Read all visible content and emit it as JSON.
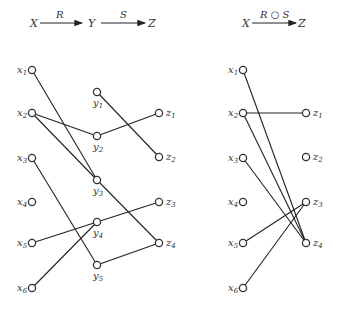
{
  "left": {
    "header": {
      "from": "X",
      "mid": "Y",
      "to": "Z",
      "rel1": "R",
      "rel2": "S"
    },
    "x_nodes": [
      "1",
      "2",
      "3",
      "4",
      "5",
      "6"
    ],
    "y_nodes": [
      "1",
      "2",
      "3",
      "4",
      "5"
    ],
    "z_nodes": [
      "1",
      "2",
      "3",
      "4"
    ],
    "R": [
      [
        "x1",
        "y3"
      ],
      [
        "x2",
        "y2"
      ],
      [
        "x2",
        "y3"
      ],
      [
        "x3",
        "y5"
      ],
      [
        "x5",
        "y4"
      ],
      [
        "x6",
        "y4"
      ]
    ],
    "S": [
      [
        "y1",
        "z2"
      ],
      [
        "y2",
        "z1"
      ],
      [
        "y3",
        "z4"
      ],
      [
        "y4",
        "z3"
      ],
      [
        "y5",
        "z4"
      ]
    ]
  },
  "right": {
    "header": {
      "from": "X",
      "to": "Z",
      "rel": "R ○ S"
    },
    "x_nodes": [
      "1",
      "2",
      "3",
      "4",
      "5",
      "6"
    ],
    "z_nodes": [
      "1",
      "2",
      "3",
      "4"
    ],
    "RS": [
      [
        "x1",
        "z4"
      ],
      [
        "x2",
        "z1"
      ],
      [
        "x2",
        "z4"
      ],
      [
        "x3",
        "z4"
      ],
      [
        "x5",
        "z3"
      ],
      [
        "x6",
        "z3"
      ]
    ]
  }
}
